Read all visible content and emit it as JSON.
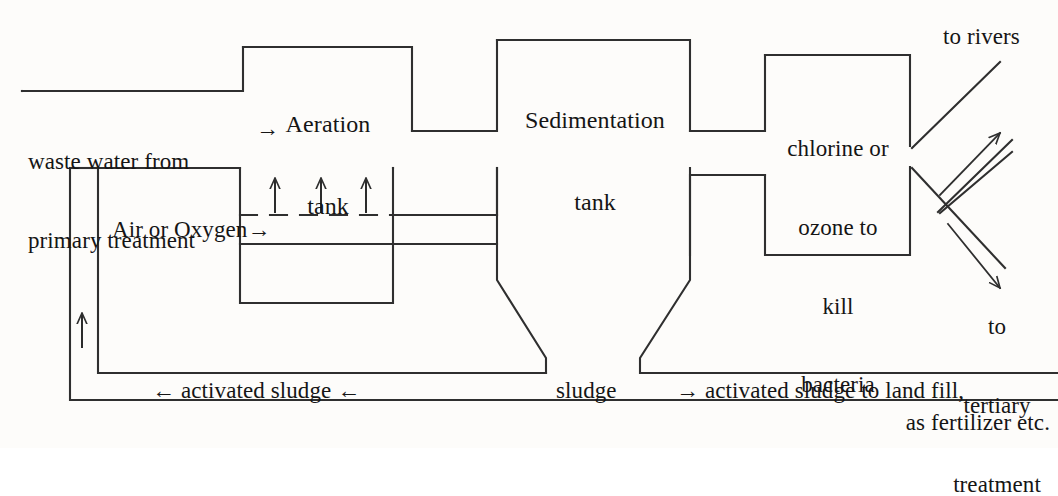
{
  "diagram": {
    "line_color": "#2f2f2f",
    "text_color": "#151515",
    "background": "#fdfcfa"
  },
  "labels": {
    "inlet_line1": "waste water from",
    "inlet_line2": "primary treatment",
    "inlet_arrow": "→",
    "aeration_line1": "Aeration",
    "aeration_line2": "tank",
    "sedimentation_line1": "Sedimentation",
    "sedimentation_line2": "tank",
    "air_oxygen": "Air or Oxygen→",
    "chlorine_line1": "chlorine or",
    "chlorine_line2": "ozone to",
    "chlorine_line3": "kill",
    "chlorine_line4": "bacteria",
    "to_rivers": "to rivers",
    "to_tertiary_line1": "to",
    "to_tertiary_line2": "tertiary",
    "to_tertiary_line3": "treatment",
    "return_sludge": "← activated sludge ←",
    "sludge": "sludge",
    "sludge_to_land_line1": "→ activated sludge to land fill,",
    "sludge_to_land_line2": "as fertilizer etc."
  }
}
